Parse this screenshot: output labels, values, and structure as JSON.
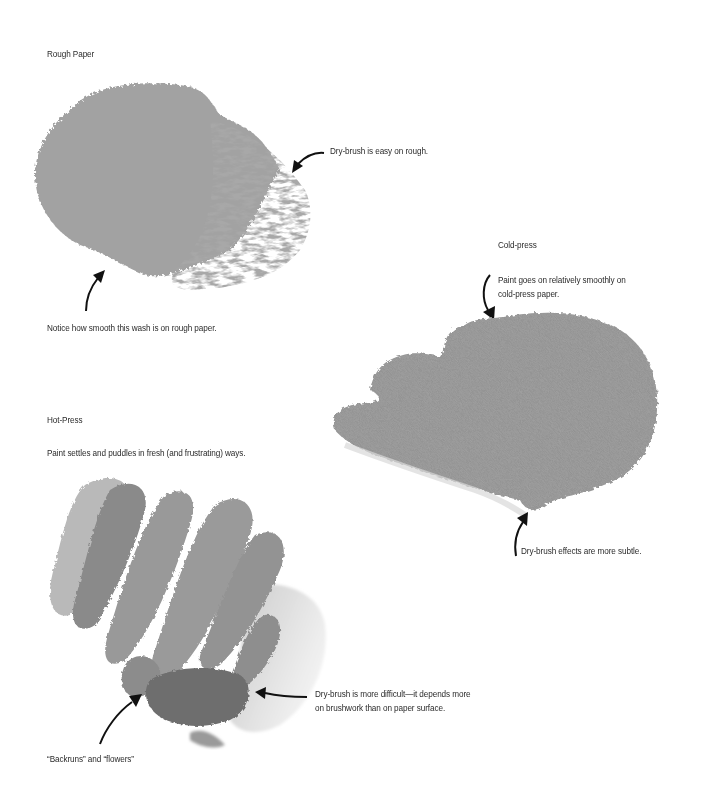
{
  "sections": {
    "rough": {
      "title": "Rough Paper",
      "caption_drybrush": "Dry-brush is easy on rough.",
      "caption_smooth": "Notice how smooth this wash is on rough paper.",
      "swatch_color": "#a3a3a3"
    },
    "cold": {
      "title": "Cold-press",
      "caption_paint_line1": "Paint goes on relatively smoothly on",
      "caption_paint_line2": "cold-press paper.",
      "caption_drybrush": "Dry-brush effects are more subtle.",
      "swatch_color": "#8e8e8e"
    },
    "hot": {
      "title": "Hot-Press",
      "subtitle": "Paint settles and puddles in fresh (and frustrating) ways.",
      "caption_drybrush_line1": "Dry-brush is more difficult—it depends more",
      "caption_drybrush_line2": "on brushwork than on paper surface.",
      "caption_backruns": "“Backruns” and “flowers”",
      "swatch_color": "#7a7a7a"
    }
  },
  "icons": {
    "arrow": "curved-arrow"
  }
}
